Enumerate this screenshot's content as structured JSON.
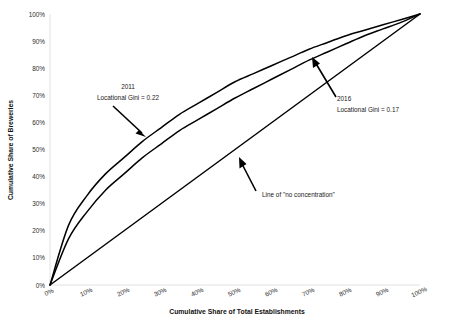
{
  "chart_data": {
    "type": "line",
    "title": "",
    "xlabel": "Cumulative Share of Total Establishments",
    "ylabel": "Cumulative Share of Breweries",
    "xlim": [
      0,
      100
    ],
    "ylim": [
      0,
      100
    ],
    "grid": false,
    "legend_position": "none",
    "x_tick_labels": [
      "0%",
      "10%",
      "20%",
      "30%",
      "40%",
      "50%",
      "60%",
      "70%",
      "80%",
      "90%",
      "100%"
    ],
    "y_tick_labels": [
      "0%",
      "10%",
      "20%",
      "30%",
      "40%",
      "50%",
      "60%",
      "70%",
      "80%",
      "90%",
      "100%"
    ],
    "x": [
      0,
      5,
      10,
      15,
      20,
      25,
      30,
      35,
      40,
      45,
      50,
      55,
      60,
      65,
      70,
      75,
      80,
      85,
      90,
      95,
      100
    ],
    "series": [
      {
        "name": "2011",
        "values": [
          0,
          22,
          33,
          41,
          47,
          53,
          58,
          63,
          67,
          71,
          75,
          78,
          81,
          84,
          87,
          89.5,
          92,
          94,
          96,
          98,
          100
        ]
      },
      {
        "name": "2016",
        "values": [
          0,
          17,
          27,
          35,
          41,
          47,
          52,
          57,
          61,
          65,
          69,
          72.5,
          76,
          79.5,
          83,
          86,
          89,
          92,
          94.5,
          97,
          100
        ]
      },
      {
        "name": "Line of \"no concentration\"",
        "values": [
          0,
          5,
          10,
          15,
          20,
          25,
          30,
          35,
          40,
          45,
          50,
          55,
          60,
          65,
          70,
          75,
          80,
          85,
          90,
          95,
          100
        ]
      }
    ],
    "annotations": [
      {
        "id": "annot-2011",
        "line1": "2011",
        "line2": "Locational Gini = 0.22",
        "target_series": "2011"
      },
      {
        "id": "annot-2016",
        "line1": "2016",
        "line2": "Locational Gini = 0.17",
        "target_series": "2016"
      },
      {
        "id": "annot-equality",
        "line1": "Line of \"no concentration\"",
        "line2": "",
        "target_series": "Line of \"no concentration\""
      }
    ]
  }
}
